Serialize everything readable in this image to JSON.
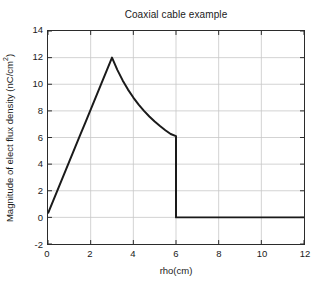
{
  "chart_data": {
    "type": "line",
    "title": "Coaxial cable example",
    "xlabel": "rho(cm)",
    "ylabel_text": "Magnitude of elect flux density (nC/cm",
    "ylabel_sup": "2",
    "ylabel_tail": ")",
    "ylabel_full": "Magnitude of elect flux density (nC/cm2)",
    "xlim": [
      0,
      12
    ],
    "ylim": [
      -2,
      14
    ],
    "xticks": [
      0,
      2,
      4,
      6,
      8,
      10,
      12
    ],
    "yticks": [
      -2,
      0,
      2,
      4,
      6,
      8,
      10,
      12,
      14
    ],
    "xtick_labels": [
      "0",
      "2",
      "4",
      "6",
      "8",
      "10",
      "12"
    ],
    "ytick_labels": [
      "-2",
      "0",
      "2",
      "4",
      "6",
      "8",
      "10",
      "12",
      "14"
    ],
    "grid": true,
    "grid_color": "#c8c8c8",
    "legend": "none",
    "line_color": "#1a1a1a",
    "line_width": 2,
    "series": [
      {
        "name": "Electric flux density magnitude",
        "x": [
          0,
          0.25,
          0.5,
          0.75,
          1,
          1.25,
          1.5,
          1.75,
          2,
          2.25,
          2.5,
          2.75,
          3,
          3.0,
          3.25,
          3.5,
          3.75,
          4,
          4.25,
          4.5,
          4.75,
          5,
          5.25,
          5.5,
          5.75,
          6,
          6,
          6.5,
          7,
          7.5,
          8,
          8.5,
          9,
          9.5,
          10,
          10.5,
          11,
          11.5,
          12
        ],
        "y": [
          0.3,
          1.275,
          2.25,
          3.225,
          4.2,
          5.175,
          6.15,
          7.125,
          8.1,
          9.075,
          10.05,
          11.025,
          12.0,
          12.0,
          11.08,
          10.29,
          9.6,
          9.0,
          8.47,
          8.0,
          7.58,
          7.2,
          6.86,
          6.55,
          6.26,
          6.1,
          0,
          0,
          0,
          0,
          0,
          0,
          0,
          0,
          0,
          0,
          0,
          0,
          0
        ],
        "description": "Linear rise 0 to 3 cm (inner conductor), 1/rho decay 3 to 6 cm (dielectric), zero beyond 6 cm (outside outer conductor)"
      }
    ],
    "annotations": {
      "peak_x": 3,
      "peak_y": 12,
      "discontinuity_x": 6,
      "discontinuity_y_top": 6.1,
      "discontinuity_y_bottom": 0,
      "start_y": 0.3
    }
  }
}
